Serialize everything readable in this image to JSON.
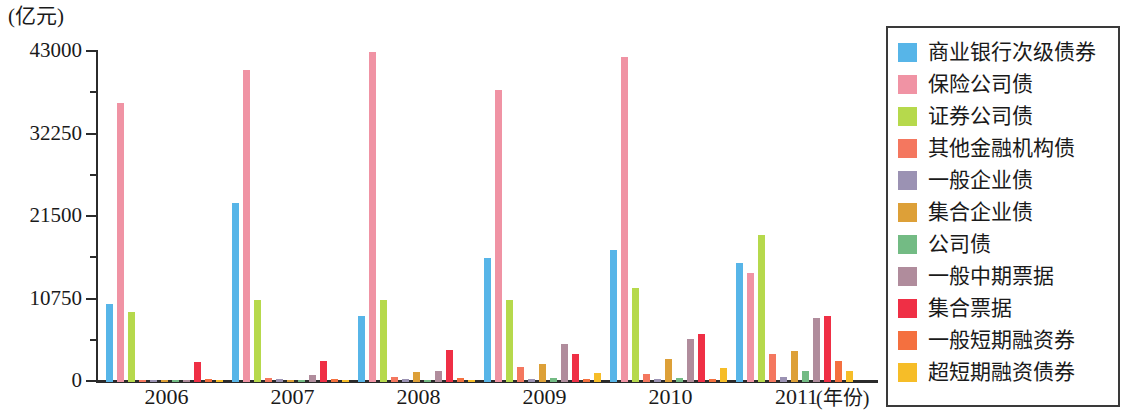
{
  "axes": {
    "y_unit_caption": "(亿元)",
    "y_ticks": [
      "0",
      "10750",
      "21500",
      "32250",
      "43000"
    ],
    "x_caption": "(年份)",
    "x_labels": [
      "2006",
      "2007",
      "2008",
      "2009",
      "2010",
      "2011"
    ]
  },
  "legend": {
    "items": [
      {
        "label": "商业银行次级债券",
        "color": "#57b5e8"
      },
      {
        "label": "保险公司债",
        "color": "#f093a4"
      },
      {
        "label": "证券公司债",
        "color": "#b2d martin"
      },
      {
        "label": "其他金融机构债",
        "color": "#f4775f"
      },
      {
        "label": "一般企业债",
        "color": "#9b92b3"
      },
      {
        "label": "集合企业债",
        "color": "#dda038"
      },
      {
        "label": "公司债",
        "color": "#73bb84"
      },
      {
        "label": "一般中期票据",
        "color": "#b08c9c"
      },
      {
        "label": "集合票据",
        "color": "#ef2f45"
      },
      {
        "label": "一般短期融资券",
        "color": "#f4703f"
      },
      {
        "label": "超短期融资债券",
        "color": "#f6bd28"
      }
    ]
  },
  "chart_data": {
    "type": "bar",
    "title": "",
    "xlabel": "(年份)",
    "ylabel": "(亿元)",
    "ylim": [
      0,
      43000
    ],
    "yticks": [
      0,
      10750,
      21500,
      32250,
      43000
    ],
    "grid": false,
    "legend_position": "right",
    "categories": [
      "2006",
      "2007",
      "2008",
      "2009",
      "2010",
      "2011"
    ],
    "series": [
      {
        "name": "商业银行次级债券",
        "color": "#57b5e8",
        "values": [
          10200,
          23300,
          8600,
          16200,
          17200,
          15500
        ]
      },
      {
        "name": "保险公司债",
        "color": "#f093a4",
        "values": [
          36300,
          40700,
          43000,
          38000,
          42400,
          14200
        ]
      },
      {
        "name": "证券公司债",
        "color": "#b6d94c",
        "values": [
          9100,
          10650,
          10700,
          10650,
          12200,
          19200
        ]
      },
      {
        "name": "其他金融机构债",
        "color": "#f4775f",
        "values": [
          300,
          480,
          600,
          2000,
          1100,
          3600
        ]
      },
      {
        "name": "一般企业债",
        "color": "#9b92b3",
        "values": [
          220,
          330,
          350,
          400,
          420,
          700
        ]
      },
      {
        "name": "集合企业债",
        "color": "#dda038",
        "values": [
          180,
          300,
          1250,
          2400,
          3000,
          4100
        ]
      },
      {
        "name": "公司债",
        "color": "#73bb84",
        "values": [
          120,
          260,
          280,
          560,
          520,
          1500
        ]
      },
      {
        "name": "一般中期票据",
        "color": "#b08c9c",
        "values": [
          150,
          900,
          1500,
          5000,
          5600,
          8300
        ]
      },
      {
        "name": "集合票据",
        "color": "#ef2f45",
        "values": [
          2600,
          2800,
          4200,
          3700,
          6300,
          8600
        ]
      },
      {
        "name": "一般短期融资券",
        "color": "#f4703f",
        "values": [
          400,
          330,
          550,
          420,
          430,
          2700
        ]
      },
      {
        "name": "超短期融资债券",
        "color": "#f6bd28",
        "values": [
          180,
          200,
          300,
          1200,
          1800,
          1400
        ]
      }
    ]
  }
}
